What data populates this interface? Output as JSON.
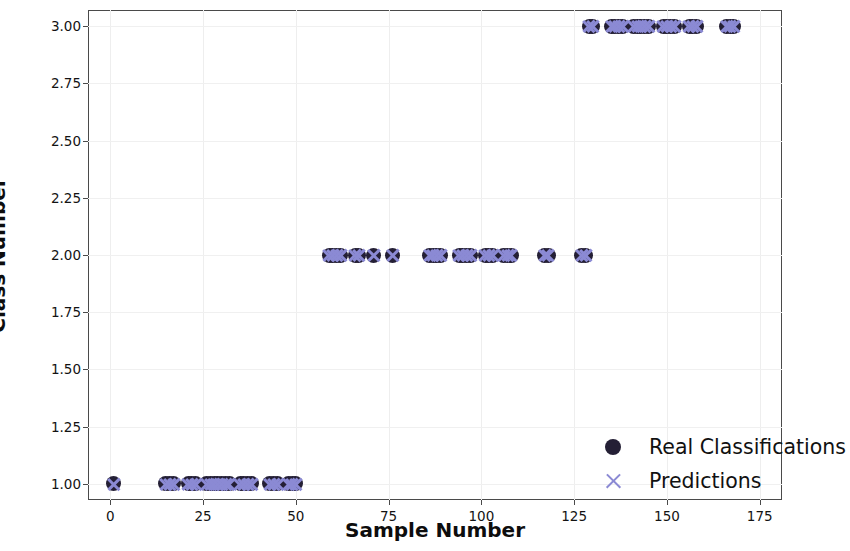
{
  "chart_data": {
    "type": "scatter",
    "title": "",
    "xlabel": "Sample Number",
    "ylabel": "Class Number",
    "xlim": [
      -6,
      181
    ],
    "ylim": [
      0.93,
      3.07
    ],
    "grid": true,
    "legend_position": "lower right",
    "xticks": [
      "0",
      "25",
      "50",
      "75",
      "100",
      "125",
      "150",
      "175"
    ],
    "xtick_values": [
      0,
      25,
      50,
      75,
      100,
      125,
      150,
      175
    ],
    "yticks": [
      "1.00",
      "1.25",
      "1.50",
      "1.75",
      "2.00",
      "2.25",
      "2.50",
      "2.75",
      "3.00"
    ],
    "ytick_values": [
      1.0,
      1.25,
      1.5,
      1.75,
      2.0,
      2.25,
      2.5,
      2.75,
      3.0
    ],
    "series": [
      {
        "name": "Real Classifications",
        "marker": "circle",
        "color": "#241f35",
        "x": [
          1,
          15,
          16,
          17,
          21,
          22,
          23,
          26,
          27,
          28,
          29,
          30,
          31,
          32,
          35,
          36,
          37,
          38,
          43,
          44,
          45,
          48,
          49,
          50,
          59,
          60,
          61,
          62,
          66,
          67,
          71,
          76,
          86,
          87,
          88,
          89,
          94,
          95,
          96,
          97,
          101,
          102,
          103,
          106,
          107,
          108,
          117,
          118,
          127,
          128,
          129,
          130,
          135,
          136,
          137,
          138,
          141,
          142,
          143,
          144,
          145,
          149,
          150,
          151,
          152,
          156,
          157,
          158,
          166,
          167,
          168
        ],
        "y": [
          1,
          1,
          1,
          1,
          1,
          1,
          1,
          1,
          1,
          1,
          1,
          1,
          1,
          1,
          1,
          1,
          1,
          1,
          1,
          1,
          1,
          1,
          1,
          1,
          2,
          2,
          2,
          2,
          2,
          2,
          2,
          2,
          2,
          2,
          2,
          2,
          2,
          2,
          2,
          2,
          2,
          2,
          2,
          2,
          2,
          2,
          2,
          2,
          2,
          2,
          3,
          3,
          3,
          3,
          3,
          3,
          3,
          3,
          3,
          3,
          3,
          3,
          3,
          3,
          3,
          3,
          3,
          3,
          3,
          3,
          3
        ]
      },
      {
        "name": "Predictions",
        "marker": "x",
        "color": "#8b8ad4",
        "x": [
          1,
          15,
          16,
          17,
          21,
          22,
          23,
          26,
          27,
          28,
          29,
          30,
          31,
          32,
          35,
          36,
          37,
          38,
          43,
          44,
          45,
          48,
          49,
          50,
          59,
          60,
          61,
          62,
          66,
          67,
          71,
          76,
          86,
          87,
          88,
          89,
          94,
          95,
          96,
          97,
          101,
          102,
          103,
          106,
          107,
          108,
          117,
          118,
          127,
          128,
          129,
          130,
          135,
          136,
          137,
          138,
          141,
          142,
          143,
          144,
          145,
          149,
          150,
          151,
          152,
          156,
          157,
          158,
          166,
          167,
          168
        ],
        "y": [
          1,
          1,
          1,
          1,
          1,
          1,
          1,
          1,
          1,
          1,
          1,
          1,
          1,
          1,
          1,
          1,
          1,
          1,
          1,
          1,
          1,
          1,
          1,
          1,
          2,
          2,
          2,
          2,
          2,
          2,
          2,
          2,
          2,
          2,
          2,
          2,
          2,
          2,
          2,
          2,
          2,
          2,
          2,
          2,
          2,
          2,
          2,
          2,
          2,
          2,
          3,
          3,
          3,
          3,
          3,
          3,
          3,
          3,
          3,
          3,
          3,
          3,
          3,
          3,
          3,
          3,
          3,
          3,
          3,
          3,
          3
        ]
      }
    ]
  },
  "legend": {
    "entries": [
      {
        "label": "Real Classifications",
        "marker": "circle"
      },
      {
        "label": "Predictions",
        "marker": "x"
      }
    ]
  }
}
